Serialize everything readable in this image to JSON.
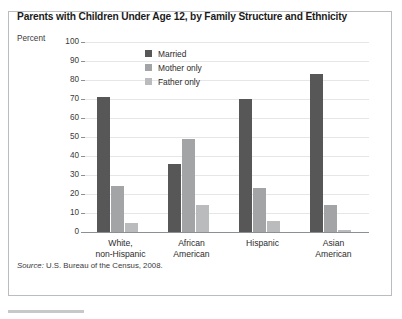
{
  "figure": {
    "title": "Parents with Children Under Age 12, by Family Structure and Ethnicity",
    "source_label": "Source:",
    "source_text": " U.S. Bureau of the Census, 2008."
  },
  "colors": {
    "married": "#575757",
    "mother_only": "#a2a4a6",
    "father_only": "#b9bbbd",
    "gridline": "#e4e6e8",
    "axis": "#8c9094",
    "frame": "#b9bcc0"
  },
  "chart_data": {
    "type": "bar",
    "title": "Parents with Children Under Age 12, by Family Structure and Ethnicity",
    "xlabel": "",
    "ylabel": "Percent",
    "ylim": [
      0,
      100
    ],
    "yticks": [
      0,
      10,
      20,
      30,
      40,
      50,
      60,
      70,
      80,
      90,
      100
    ],
    "grid": true,
    "legend_position": "inside-top-center",
    "categories": [
      "White,\nnon-Hispanic",
      "African\nAmerican",
      "Hispanic",
      "Asian\nAmerican"
    ],
    "category_lines": [
      [
        "White,",
        "non-Hispanic"
      ],
      [
        "African",
        "American"
      ],
      [
        "Hispanic",
        ""
      ],
      [
        "Asian",
        "American"
      ]
    ],
    "series": [
      {
        "name": "Married",
        "color": "#575757",
        "values": [
          71,
          36,
          70,
          83
        ]
      },
      {
        "name": "Mother only",
        "color": "#a2a4a6",
        "values": [
          24,
          49,
          23,
          14
        ]
      },
      {
        "name": "Father only",
        "color": "#b9bbbd",
        "values": [
          5,
          14,
          6,
          1
        ]
      }
    ]
  }
}
